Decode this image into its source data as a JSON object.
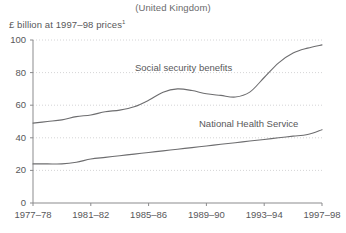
{
  "chart_data": {
    "type": "line",
    "title": "(United Kingdom)",
    "ylabel": "£ billion at 1997–98 prices",
    "ylabel_footnote": "1",
    "xlabel": "",
    "ylim": [
      0,
      100
    ],
    "yticks": [
      0,
      20,
      40,
      60,
      80,
      100
    ],
    "ytick_labels": [
      "0",
      "20",
      "40",
      "60",
      "80",
      "100"
    ],
    "xtick_labels": [
      "1977–78",
      "1981–82",
      "1985–86",
      "1989–90",
      "1993–94",
      "1997–98"
    ],
    "x": [
      "1977-78",
      "1978-79",
      "1979-80",
      "1980-81",
      "1981-82",
      "1982-83",
      "1983-84",
      "1984-85",
      "1985-86",
      "1986-87",
      "1987-88",
      "1988-89",
      "1989-90",
      "1990-91",
      "1991-92",
      "1992-93",
      "1993-94",
      "1994-95",
      "1995-96",
      "1996-97",
      "1997-98"
    ],
    "grid": "horizontal-dotted",
    "legend": "inline-annotations",
    "series": [
      {
        "name": "Social security benefits",
        "color": "#6d6d6f",
        "label_x_pct": 40,
        "values": [
          49,
          50,
          51,
          53,
          54,
          56,
          57,
          59,
          63,
          68,
          70,
          69,
          67,
          66,
          65,
          68,
          77,
          86,
          92,
          95,
          97
        ]
      },
      {
        "name": "National Health Service",
        "color": "#6d6d6f",
        "label_x_pct": 68,
        "values": [
          24,
          24,
          24,
          25,
          27,
          28,
          29,
          30,
          31,
          32,
          33,
          34,
          35,
          36,
          37,
          38,
          39,
          40,
          41,
          42,
          45
        ]
      }
    ],
    "annotations": [
      {
        "text": "Social security benefits",
        "x": 135,
        "y": 62
      },
      {
        "text": "National Health Service",
        "x": 199,
        "y": 118
      }
    ]
  },
  "colors": {
    "line": "#6d6d6f",
    "axis": "#8b8b8d",
    "grid": "#c9c9cb",
    "text": "#58585a",
    "background": "#ffffff"
  }
}
